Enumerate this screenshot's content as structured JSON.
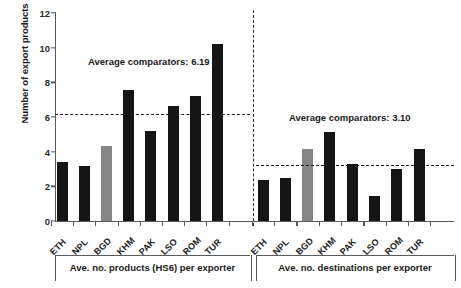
{
  "chart_data": {
    "type": "bar",
    "title": "",
    "xlabel": "",
    "ylabel": "Number of export products",
    "ylim": [
      0,
      12
    ],
    "yticks": [
      0,
      2,
      4,
      6,
      8,
      10,
      12
    ],
    "ytick_labels": [
      "0",
      "2",
      "4",
      "6",
      "8",
      "10",
      "12"
    ],
    "grid": false,
    "legend": "none",
    "groups": [
      {
        "name": "Ave. no. products (HS6) per exporter",
        "caption": "Ave. no. products (HS6) per exporter",
        "categories": [
          "ETH",
          "NPL",
          "BGD",
          "KHM",
          "PAK",
          "LSO",
          "ROM",
          "TUR"
        ],
        "values": [
          3.4,
          3.2,
          4.3,
          7.55,
          5.2,
          6.65,
          7.2,
          10.2
        ],
        "colors": [
          "dark",
          "dark",
          "gray",
          "dark",
          "dark",
          "dark",
          "dark",
          "dark"
        ],
        "reference_line": {
          "label": "Average comparators: 6.19",
          "value": 6.19
        }
      },
      {
        "name": "Ave. no. destinations per exporter",
        "caption": "Ave. no. destinations per exporter",
        "categories": [
          "ETH",
          "NPL",
          "BGD",
          "KHM",
          "PAK",
          "LSO",
          "ROM",
          "TUR"
        ],
        "values": [
          2.35,
          2.5,
          4.15,
          5.15,
          3.3,
          1.45,
          3.0,
          4.15
        ],
        "colors": [
          "dark",
          "dark",
          "gray",
          "dark",
          "dark",
          "dark",
          "dark",
          "dark"
        ],
        "reference_line": {
          "label": "Average comparators: 3.10",
          "value": 3.23
        }
      }
    ],
    "colors": {
      "bar_dark": "#151515",
      "bar_gray": "#858585",
      "axis": "#5a5a5a",
      "text": "#1a1a1a",
      "background": "#ffffff"
    }
  }
}
